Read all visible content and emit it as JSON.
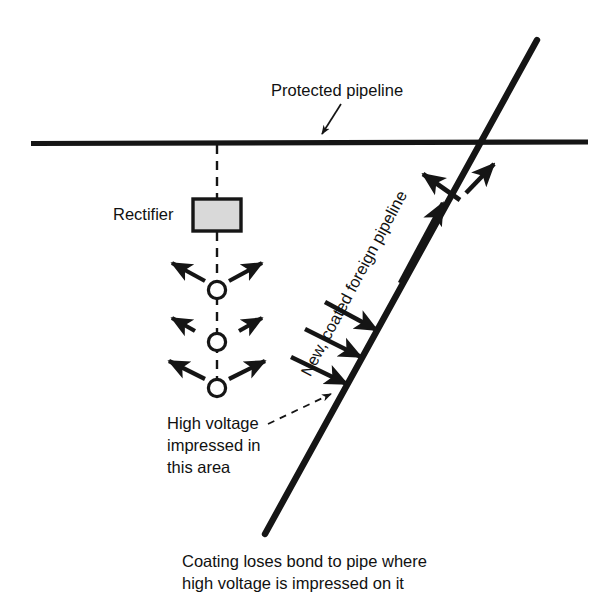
{
  "figure": {
    "type": "technical-diagram",
    "background_color": "#ffffff",
    "line_color": "#151515",
    "rectifier_fill_color": "#d9d9d9"
  },
  "labels": {
    "protected_pipeline": "Protected pipeline",
    "rectifier": "Rectifier",
    "high_voltage_line1": "High voltage",
    "high_voltage_line2": "impressed in",
    "high_voltage_line3": "this area",
    "foreign_pipeline": "New, coated foreign pipeline"
  },
  "caption": {
    "line1": "Coating loses bond to pipe where",
    "line2": "high voltage is impressed on it"
  },
  "elements": {
    "horizontal_pipeline": "protected-pipeline-line",
    "diagonal_pipeline": "foreign-pipeline-line",
    "rectifier_box": "rectifier-box",
    "anode_count": 3,
    "anode_symbol": "circle",
    "current_flow_arrows": 9,
    "leader_lines": 2,
    "dashed_cable": "rectifier-cable-dashed"
  }
}
